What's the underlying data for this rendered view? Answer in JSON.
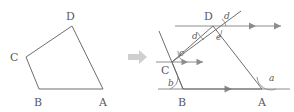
{
  "figure": {
    "transition_icon": "right-arrow-icon",
    "stroke_color": "#6e6e6e",
    "label_color": "#5a5a5a",
    "arrow_color": "#cfcfcf",
    "left": {
      "caption": "Quadrilateral ABCD",
      "vertices": [
        {
          "label": "A",
          "x": 103,
          "y": 89,
          "lx": 99,
          "ly": 104
        },
        {
          "label": "B",
          "x": 39,
          "y": 89,
          "lx": 34,
          "ly": 104
        },
        {
          "label": "C",
          "x": 26,
          "y": 57,
          "lx": 12,
          "ly": 60
        },
        {
          "label": "D",
          "x": 72,
          "y": 26,
          "lx": 67,
          "ly": 19
        }
      ],
      "edges": [
        {
          "name": "edge-AB",
          "from": "A",
          "to": "B"
        },
        {
          "name": "edge-BC",
          "from": "B",
          "to": "C"
        },
        {
          "name": "edge-CD",
          "from": "C",
          "to": "D"
        },
        {
          "name": "edge-DA",
          "from": "D",
          "to": "A"
        }
      ]
    },
    "right": {
      "caption": "Quadrilateral ABCD with parallel lines through B, C and D",
      "vertices": [
        {
          "label": "A",
          "x": 262,
          "y": 89,
          "lx": 258,
          "ly": 104
        },
        {
          "label": "B",
          "x": 183,
          "y": 89,
          "lx": 178,
          "ly": 104
        },
        {
          "label": "C",
          "x": 172,
          "y": 62,
          "lx": 162,
          "ly": 72
        },
        {
          "label": "D",
          "x": 213,
          "y": 26,
          "lx": 205,
          "ly": 19
        }
      ],
      "edges": [
        {
          "name": "edge-AB",
          "from": "A",
          "to": "B"
        },
        {
          "name": "edge-BC",
          "from": "B",
          "to": "C"
        },
        {
          "name": "edge-CD",
          "from": "C",
          "to": "D"
        },
        {
          "name": "edge-DA",
          "from": "D",
          "to": "A"
        }
      ],
      "parallel_lines": [
        {
          "name": "parallel-line-through-B",
          "x1": 158,
          "x2": 290,
          "y": 89,
          "tick_x": 228
        },
        {
          "name": "parallel-line-through-C",
          "x1": 156,
          "x2": 206,
          "y": 62,
          "tick_x": 190
        },
        {
          "name": "parallel-line-through-D",
          "x1": 175,
          "x2": 285,
          "y": 26,
          "tick_x": 252
        }
      ],
      "extensions": [
        {
          "name": "extension-of-BC-beyond-C",
          "x1": 183,
          "y1": 89,
          "x2": 160,
          "y2": 33
        },
        {
          "name": "extension-of-CD-beyond-D",
          "x1": 172,
          "y1": 62,
          "x2": 240,
          "y2": 12
        }
      ],
      "angles": [
        {
          "name": "angle-a-at-A",
          "label": "a",
          "lx": 272,
          "ly": 79
        },
        {
          "name": "angle-b-at-B",
          "label": "b",
          "lx": 172,
          "ly": 84
        },
        {
          "name": "angle-c-at-C",
          "label": "c",
          "lx": 181,
          "ly": 54
        },
        {
          "name": "angle-d-lower-at-D",
          "label": "d",
          "lx": 197,
          "ly": 37
        },
        {
          "name": "angle-d-upper-at-D",
          "label": "d",
          "lx": 226,
          "ly": 21
        },
        {
          "name": "angle-e-at-D",
          "label": "e",
          "lx": 219,
          "ly": 38
        }
      ]
    }
  }
}
